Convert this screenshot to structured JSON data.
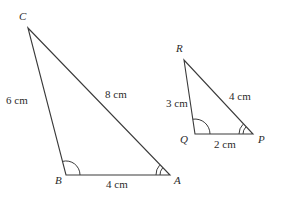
{
  "diagram": {
    "triangles": [
      {
        "name": "ABC",
        "vertices": {
          "A": {
            "label": "A"
          },
          "B": {
            "label": "B"
          },
          "C": {
            "label": "C"
          }
        },
        "sides": {
          "BC": "6 cm",
          "CA": "8 cm",
          "AB": "4 cm"
        },
        "angle_marks": {
          "B": "single arc",
          "A": "double arc"
        }
      },
      {
        "name": "PQR",
        "vertices": {
          "P": {
            "label": "P"
          },
          "Q": {
            "label": "Q"
          },
          "R": {
            "label": "R"
          }
        },
        "sides": {
          "QR": "3 cm",
          "RP": "4 cm",
          "QP": "2 cm"
        },
        "angle_marks": {
          "Q": "single arc",
          "P": "double arc"
        }
      }
    ],
    "colors": {
      "stroke": "#3a3a3a",
      "text": "#2b2b2b",
      "background": "#ffffff"
    }
  }
}
